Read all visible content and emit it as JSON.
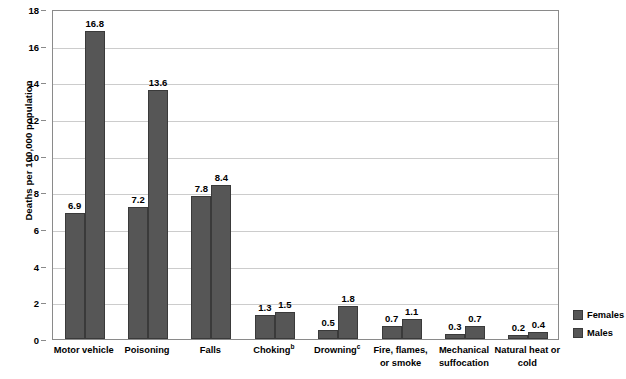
{
  "chart_data": {
    "type": "bar",
    "title": "",
    "subtitle": "",
    "xlabel": "",
    "ylabel": "Deaths per 100,000 population",
    "ylim": [
      0,
      18
    ],
    "ytick_step": 2,
    "yticks": [
      "0",
      "2",
      "4",
      "6",
      "8",
      "10",
      "12",
      "14",
      "16",
      "18"
    ],
    "grid": "horizontal",
    "legend_position": "right-bottom-outside",
    "bar_color": "#565656",
    "gridline_color": "#cccccc",
    "axis_color": "#8a8a8a",
    "categories": [
      "Motor vehicle",
      "Poisoning",
      "Falls",
      "Choking",
      "Drowning",
      "Fire, flames,\nor smoke",
      "Mechanical\nsuffocation",
      "Natural heat or\ncold"
    ],
    "category_footnotes": [
      "",
      "",
      "",
      "b",
      "c",
      "",
      "",
      ""
    ],
    "series": [
      {
        "name": "Females",
        "values": [
          6.9,
          7.2,
          7.8,
          1.3,
          0.5,
          0.7,
          0.3,
          0.2
        ],
        "labels": [
          "6.9",
          "7.2",
          "7.8",
          "1.3",
          "0.5",
          "0.7",
          "0.3",
          "0.2"
        ]
      },
      {
        "name": "Males",
        "values": [
          16.8,
          13.6,
          8.4,
          1.5,
          1.8,
          1.1,
          0.7,
          0.4
        ],
        "labels": [
          "16.8",
          "13.6",
          "8.4",
          "1.5",
          "1.8",
          "1.1",
          "0.7",
          "0.4"
        ]
      }
    ]
  },
  "legend": {
    "items": [
      {
        "label": "Females",
        "color": "#565656"
      },
      {
        "label": "Males",
        "color": "#565656"
      }
    ]
  }
}
